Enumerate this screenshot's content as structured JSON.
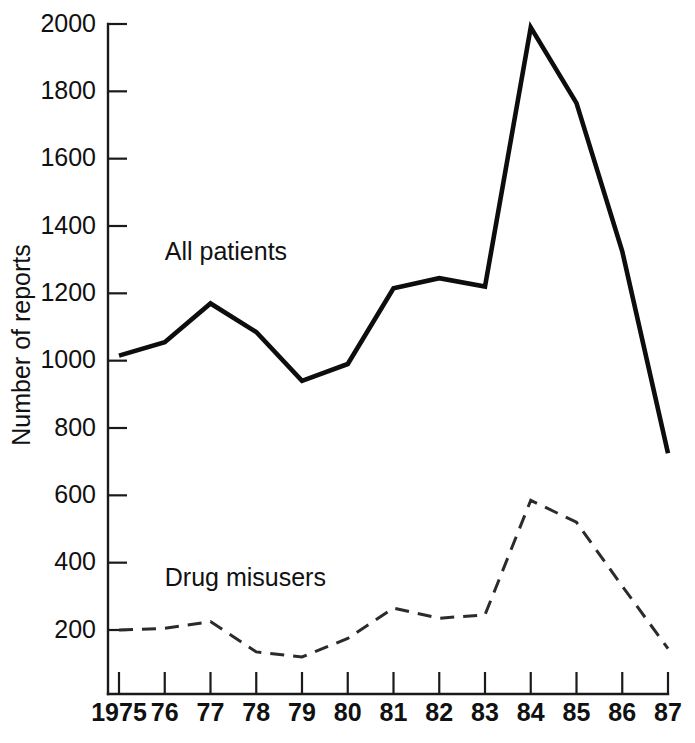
{
  "chart_data": {
    "type": "line",
    "title": "",
    "xlabel": "",
    "ylabel": "Number of reports",
    "x": [
      1975,
      1976,
      1977,
      1978,
      1979,
      1980,
      1981,
      1982,
      1983,
      1984,
      1985,
      1986,
      1987
    ],
    "xtick_labels": [
      "1975",
      "76",
      "77",
      "78",
      "79",
      "80",
      "81",
      "82",
      "83",
      "84",
      "85",
      "86",
      "87"
    ],
    "ytick_labels": [
      "2000",
      "1800",
      "1600",
      "1400",
      "1200",
      "1000",
      "800",
      "600",
      "400",
      "200"
    ],
    "ytick_values": [
      2000,
      1800,
      1600,
      1400,
      1200,
      1000,
      800,
      600,
      400,
      200
    ],
    "ylim": [
      0,
      2000
    ],
    "xlim": [
      1975,
      1987
    ],
    "grid": false,
    "legend_position": "inline-annotation",
    "series": [
      {
        "name": "All patients",
        "style": "solid",
        "color": "#0d0d0d",
        "label_x": 1976.0,
        "label_y": 1300,
        "values": [
          1015,
          1055,
          1170,
          1085,
          940,
          990,
          1215,
          1245,
          1220,
          1990,
          1765,
          1325,
          725
        ]
      },
      {
        "name": "Drug misusers",
        "style": "dashed",
        "color": "#2b2b2b",
        "label_x": 1976.0,
        "label_y": 330,
        "values": [
          200,
          205,
          225,
          135,
          120,
          175,
          265,
          235,
          245,
          585,
          520,
          330,
          145
        ]
      }
    ]
  },
  "annotations": {
    "series_1_label": "All patients",
    "series_2_label": "Drug misusers"
  }
}
